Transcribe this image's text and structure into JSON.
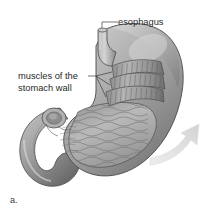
{
  "figure": {
    "caption": "a.",
    "background_color": "#ffffff",
    "ink_color": "#2a2a2a"
  },
  "labels": {
    "esophagus": "esophagus",
    "muscles_line1": "muscles of the",
    "muscles_line2": "stomach wall"
  },
  "illustration": {
    "arrow_color": "#e2e2e2",
    "organ_fill_light": "#cfcfcf",
    "organ_fill_mid": "#a8a8a8",
    "organ_fill_dark": "#6e6e6e",
    "outline_color": "#4a4a4a",
    "muscle_band_count": 3,
    "rugae_line_count": 14
  }
}
